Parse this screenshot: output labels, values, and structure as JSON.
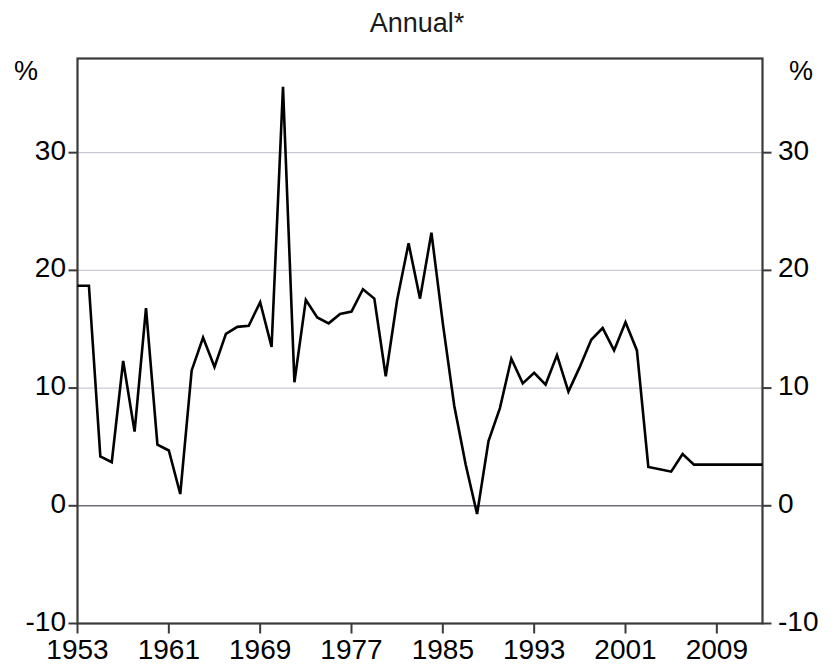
{
  "chart_data": {
    "type": "line",
    "title": "Annual*",
    "xlabel": "",
    "ylabel": "%",
    "ylabel_right": "%",
    "ylim": [
      -10,
      38
    ],
    "xlim": [
      1953,
      2013
    ],
    "yticks": [
      -10,
      0,
      10,
      20,
      30
    ],
    "ytick_labels": [
      "-10",
      "0",
      "10",
      "20",
      "30"
    ],
    "xticks": [
      1953,
      1961,
      1969,
      1977,
      1985,
      1993,
      2001,
      2009
    ],
    "xtick_labels": [
      "1953",
      "1961",
      "1969",
      "1977",
      "1985",
      "1993",
      "2001",
      "2009"
    ],
    "grid": true,
    "gridlines_y": [
      10,
      20,
      30
    ],
    "zero_line": 0,
    "legend": null,
    "line_color": "#000000",
    "line_width": 2.6,
    "series": [
      {
        "name": "Annual",
        "x": [
          1953,
          1954,
          1955,
          1956,
          1957,
          1958,
          1959,
          1960,
          1961,
          1962,
          1963,
          1964,
          1965,
          1966,
          1967,
          1968,
          1969,
          1970,
          1971,
          1972,
          1973,
          1974,
          1975,
          1976,
          1977,
          1978,
          1979,
          1980,
          1981,
          1982,
          1983,
          1984,
          1985,
          1986,
          1987,
          1988,
          1989,
          1990,
          1991,
          1992,
          1993,
          1994,
          1995,
          1996,
          1997,
          1998,
          1999,
          2000,
          2001,
          2002,
          2003,
          2004,
          2005,
          2006,
          2007,
          2008,
          2009,
          2010,
          2011,
          2012,
          2013
        ],
        "values": [
          18.7,
          18.7,
          4.2,
          3.7,
          12.3,
          6.3,
          16.8,
          5.2,
          4.7,
          1.0,
          11.5,
          14.3,
          11.8,
          14.6,
          15.2,
          15.3,
          17.3,
          13.5,
          35.6,
          10.5,
          17.5,
          16.0,
          15.5,
          16.3,
          16.5,
          18.4,
          17.6,
          11.0,
          17.5,
          22.3,
          17.6,
          23.2,
          15.5,
          8.5,
          3.5,
          -0.7,
          5.5,
          8.3,
          12.5,
          10.4,
          11.3,
          10.3,
          12.8,
          9.7,
          11.8,
          14.1,
          15.1,
          13.2,
          15.6,
          13.2,
          3.3,
          3.1,
          2.9,
          4.4,
          3.5,
          3.5,
          3.5,
          3.5,
          3.5,
          3.5,
          3.5
        ]
      }
    ]
  },
  "chart": {
    "title": "Annual*",
    "unit_left": "%",
    "unit_right": "%"
  }
}
